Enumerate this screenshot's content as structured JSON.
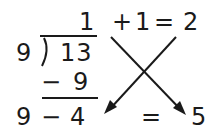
{
  "diagram": {
    "division": {
      "divisor": "9",
      "dividend": "13",
      "quotient": "1",
      "subtract_sign": "−",
      "subtract_value": "9",
      "remainder_row_left": "9",
      "remainder_row_minus": "−",
      "remainder_row_right": "4"
    },
    "top_equation": {
      "plus": "+",
      "addend": "1",
      "equals": "=",
      "result": "2"
    },
    "bottom_equation": {
      "equals": "=",
      "result": "5"
    },
    "colors": {
      "ink": "#1a1a1a",
      "background": "#ffffff"
    }
  }
}
